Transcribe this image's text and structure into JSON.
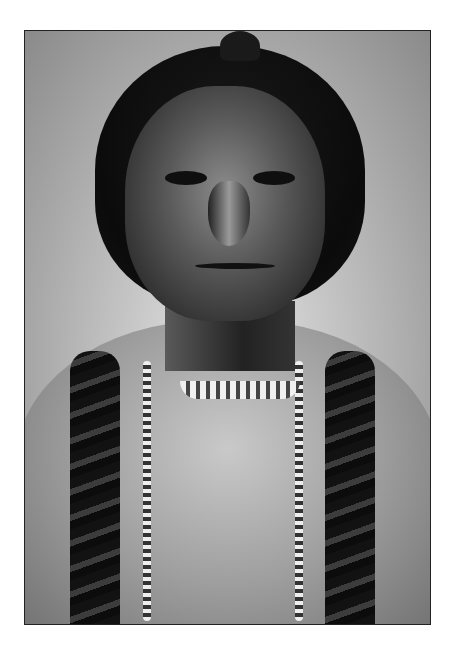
{
  "image": {
    "description": "Black-and-white historical portrait photograph of a Native American man with long dark hair in braids, wearing a beaded necklace and choker over a light hide shirt",
    "style": "monochrome vintage photograph",
    "colors": {
      "background_page": "#ffffff",
      "photo_background": "#bdbdbd",
      "hair": "#0b0b0b",
      "skin_shadow": "#2e2e2e",
      "shirt": "#9e9e9e"
    },
    "frame": {
      "x": 24,
      "y": 30,
      "width": 405,
      "height": 593
    }
  }
}
